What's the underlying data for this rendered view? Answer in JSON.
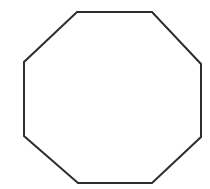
{
  "figure": {
    "name": "octagon",
    "title": "Regular octagon outline",
    "canvas": {
      "width": 210,
      "height": 189,
      "background_color": "#ffffff"
    },
    "shape": {
      "kind": "polygon",
      "sides": 8,
      "label": "octagon",
      "fill_color": "#ffffff",
      "stroke_color": "#2e2e2e",
      "stroke_width": 2,
      "points": "77,12 152,12 201,64 201,137 152,183 78,183 24,136 24,62",
      "vertices": [
        {
          "name": "top-left",
          "x": 77,
          "y": 12
        },
        {
          "name": "top-right",
          "x": 152,
          "y": 12
        },
        {
          "name": "right-upper",
          "x": 201,
          "y": 64
        },
        {
          "name": "right-lower",
          "x": 201,
          "y": 137
        },
        {
          "name": "bottom-right",
          "x": 152,
          "y": 183
        },
        {
          "name": "bottom-left",
          "x": 78,
          "y": 183
        },
        {
          "name": "left-lower",
          "x": 24,
          "y": 136
        },
        {
          "name": "left-upper",
          "x": 24,
          "y": 62
        }
      ]
    }
  }
}
